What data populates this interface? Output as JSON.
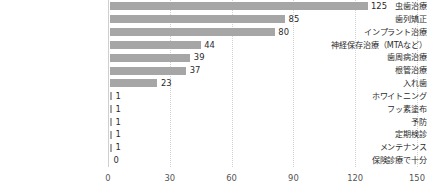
{
  "chart_data": {
    "type": "bar",
    "orientation": "horizontal",
    "title": "",
    "xlabel": "",
    "ylabel": "",
    "xlim": [
      0,
      150
    ],
    "xticks": [
      0,
      30,
      60,
      90,
      120,
      150
    ],
    "grid": true,
    "legend": false,
    "bar_color": "#a6a6a6",
    "categories": [
      "虫歯治療",
      "歯列矯正",
      "インプラント治療",
      "神経保存治療（MTAなど）",
      "歯周病治療",
      "根管治療",
      "入れ歯",
      "ホワイトニング",
      "フッ素塗布",
      "予防",
      "定期検診",
      "メンテナンス",
      "保険診療で十分"
    ],
    "values": [
      125,
      85,
      80,
      44,
      39,
      37,
      23,
      1,
      1,
      1,
      1,
      1,
      0
    ],
    "value_labels": [
      "125",
      "85",
      "80",
      "44",
      "39",
      "37",
      "23",
      "1",
      "1",
      "1",
      "1",
      "1",
      "0"
    ]
  }
}
